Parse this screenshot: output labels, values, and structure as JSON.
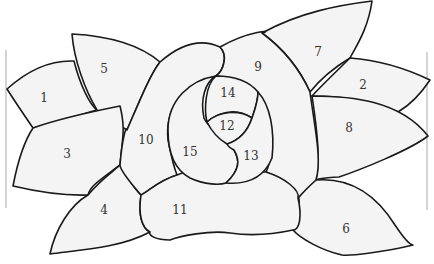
{
  "diagram": {
    "line_color": "#1a1a1a",
    "fill_color": "#f4f4f4",
    "labels": [
      {
        "id": "1",
        "text": "1",
        "x": 44,
        "y": 98
      },
      {
        "id": "2",
        "text": "2",
        "x": 363,
        "y": 85
      },
      {
        "id": "3",
        "text": "3",
        "x": 67,
        "y": 154
      },
      {
        "id": "4",
        "text": "4",
        "x": 104,
        "y": 210
      },
      {
        "id": "5",
        "text": "5",
        "x": 104,
        "y": 69
      },
      {
        "id": "6",
        "text": "6",
        "x": 346,
        "y": 229
      },
      {
        "id": "7",
        "text": "7",
        "x": 318,
        "y": 52
      },
      {
        "id": "8",
        "text": "8",
        "x": 349,
        "y": 128
      },
      {
        "id": "9",
        "text": "9",
        "x": 258,
        "y": 67
      },
      {
        "id": "10",
        "text": "10",
        "x": 146,
        "y": 140
      },
      {
        "id": "11",
        "text": "11",
        "x": 180,
        "y": 210
      },
      {
        "id": "12",
        "text": "12",
        "x": 227,
        "y": 126
      },
      {
        "id": "13",
        "text": "13",
        "x": 251,
        "y": 156
      },
      {
        "id": "14",
        "text": "14",
        "x": 228,
        "y": 93
      },
      {
        "id": "15",
        "text": "15",
        "x": 190,
        "y": 152
      }
    ]
  }
}
